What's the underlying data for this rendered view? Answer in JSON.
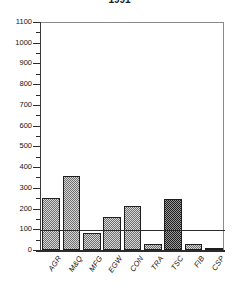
{
  "chart_data": {
    "type": "bar",
    "title": "1991",
    "xlabel": "",
    "ylabel": "",
    "ylim": [
      0,
      1100
    ],
    "ytick_step": 100,
    "grid": false,
    "legend": null,
    "categories": [
      "AGR",
      "M&Q",
      "MFG",
      "EGW",
      "CON",
      "TRA",
      "TSC",
      "FIB",
      "CSP"
    ],
    "values": [
      250,
      355,
      80,
      160,
      212,
      28,
      248,
      28,
      12
    ],
    "ytick_labels": [
      "1100",
      "1000",
      "900",
      "800",
      "700",
      "600",
      "500",
      "400",
      "300",
      "200",
      "100",
      "0"
    ],
    "ytick_values": [
      1100,
      1000,
      900,
      800,
      700,
      600,
      500,
      400,
      300,
      200,
      100,
      0
    ],
    "annotations": [
      {
        "name": "reference-line",
        "type": "hline",
        "value": 95
      }
    ],
    "series_style": [
      {
        "category": "AGR",
        "fill": "light-checker"
      },
      {
        "category": "M&Q",
        "fill": "light-checker"
      },
      {
        "category": "MFG",
        "fill": "light-checker"
      },
      {
        "category": "EGW",
        "fill": "light-checker"
      },
      {
        "category": "CON",
        "fill": "light-checker"
      },
      {
        "category": "TRA",
        "fill": "light-checker"
      },
      {
        "category": "TSC",
        "fill": "dark-checker"
      },
      {
        "category": "FIB",
        "fill": "light-checker"
      },
      {
        "category": "CSP",
        "fill": "light-checker"
      }
    ],
    "colors": {
      "bar_fill": "#d8d8d8",
      "bar_pattern": "#6e6e6e",
      "bar_fill_dark": "#9a9a9a",
      "bar_pattern_dark": "#1e1e1e",
      "bar_border": "#1d1d1d",
      "axis": "#2b2b2b",
      "frame": "#8a8a8a",
      "text": "#111111",
      "background": "#ffffff"
    }
  }
}
